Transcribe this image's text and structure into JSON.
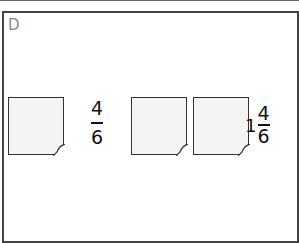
{
  "label": "D",
  "items": [
    {
      "type": "sheets",
      "count": 1
    },
    {
      "type": "fraction",
      "numerator": "4",
      "denominator": "6"
    },
    {
      "type": "sheets",
      "count": 2
    },
    {
      "type": "mixed",
      "whole": "1",
      "numerator": "4",
      "denominator": "6"
    }
  ]
}
